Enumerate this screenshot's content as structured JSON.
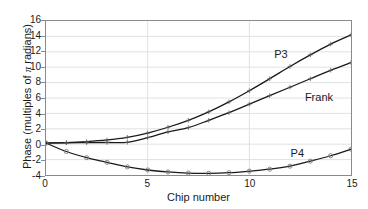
{
  "chart_data": {
    "type": "line",
    "title": "",
    "xlabel": "Chip number",
    "ylabel": "Phase (multiples of π radians)",
    "ylabel_parts": {
      "before": "Phase (multiples of ",
      "symbol": "π",
      "after": " radians)"
    },
    "xlim": [
      0,
      15
    ],
    "ylim": [
      -4,
      16
    ],
    "xticks": [
      0,
      5,
      10,
      15
    ],
    "xtick_labels": [
      "0",
      "5",
      "10",
      "15"
    ],
    "yticks": [
      -4,
      -2,
      0,
      2,
      4,
      6,
      8,
      10,
      12,
      14,
      16
    ],
    "ytick_labels": [
      "-4",
      "-2",
      "0",
      "2",
      "4",
      "6",
      "8",
      "10",
      "12",
      "14",
      "16"
    ],
    "grid": true,
    "grid_color": "#d9d9d9",
    "axis_color": "#8a8a8a",
    "legend": "none",
    "x": [
      0,
      1,
      2,
      3,
      4,
      5,
      6,
      7,
      8,
      9,
      10,
      11,
      12,
      13,
      14,
      15
    ],
    "series": [
      {
        "name": "P3",
        "color": "#1a1a1a",
        "marker": "plus",
        "annotation": "P3",
        "annotation_x": 11.2,
        "annotation_y": 11.6,
        "values": [
          0.15,
          0.2,
          0.33,
          0.55,
          0.9,
          1.45,
          2.2,
          3.1,
          4.2,
          5.5,
          6.95,
          8.5,
          10.1,
          11.6,
          13.0,
          14.2
        ]
      },
      {
        "name": "Frank",
        "color": "#1a1a1a",
        "marker": "plus",
        "annotation": "Frank",
        "annotation_x": 12.7,
        "annotation_y": 6.1,
        "values": [
          0.15,
          0.18,
          0.2,
          0.22,
          0.25,
          0.85,
          1.6,
          2.15,
          3.1,
          4.1,
          5.2,
          6.3,
          7.4,
          8.5,
          9.6,
          10.6
        ]
      },
      {
        "name": "P4",
        "color": "#1a1a1a",
        "marker": "circle",
        "annotation": "P4",
        "annotation_x": 12.0,
        "annotation_y": -1.0,
        "values": [
          0.15,
          -0.95,
          -1.75,
          -2.35,
          -2.95,
          -3.35,
          -3.6,
          -3.75,
          -3.78,
          -3.7,
          -3.5,
          -3.25,
          -2.85,
          -2.2,
          -1.5,
          -0.65
        ]
      }
    ]
  }
}
